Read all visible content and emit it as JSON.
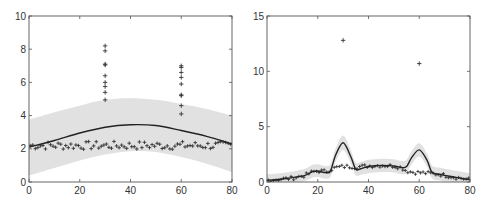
{
  "chart_data": [
    {
      "type": "scatter",
      "panel": "left",
      "title": "",
      "xlabel": "",
      "ylabel": "",
      "xlim": [
        0,
        80
      ],
      "ylim": [
        0,
        10
      ],
      "xticks": [
        0,
        20,
        40,
        60,
        80
      ],
      "yticks": [
        0,
        2,
        4,
        6,
        8,
        10
      ],
      "grid": false,
      "legend": null,
      "series": [
        {
          "name": "observations",
          "style": "plus-markers",
          "baseline_points": {
            "x_range": [
              0,
              80
            ],
            "y_approx": 2.2,
            "y_jitter": 0.25
          },
          "outliers": [
            {
              "x": 30,
              "y": [
                8.2,
                7.9,
                7.1,
                7.05,
                6.4,
                6.0,
                5.75,
                5.4,
                4.95
              ]
            },
            {
              "x": 60,
              "y": [
                7.0,
                6.9,
                6.6,
                6.3,
                5.9,
                5.25,
                5.2,
                4.6,
                4.1
              ]
            }
          ]
        },
        {
          "name": "fit",
          "style": "solid-line",
          "x": [
            0,
            10,
            20,
            30,
            40,
            50,
            60,
            70,
            80
          ],
          "y": [
            2.1,
            2.5,
            2.95,
            3.3,
            3.45,
            3.4,
            3.1,
            2.75,
            2.3
          ]
        },
        {
          "name": "confidence-band",
          "style": "shaded",
          "x": [
            0,
            10,
            20,
            30,
            40,
            50,
            60,
            70,
            80
          ],
          "upper": [
            3.75,
            4.2,
            4.6,
            4.95,
            5.05,
            4.95,
            4.7,
            4.4,
            4.0
          ],
          "lower": [
            0.4,
            0.85,
            1.3,
            1.65,
            1.85,
            1.8,
            1.5,
            1.1,
            0.6
          ]
        }
      ]
    },
    {
      "type": "scatter",
      "panel": "right",
      "title": "",
      "xlabel": "",
      "ylabel": "",
      "xlim": [
        0,
        80
      ],
      "ylim": [
        0,
        15
      ],
      "xticks": [
        0,
        20,
        40,
        60,
        80
      ],
      "yticks": [
        0,
        5,
        10,
        15
      ],
      "grid": false,
      "legend": null,
      "series": [
        {
          "name": "observations",
          "style": "plus-markers",
          "outliers": [
            {
              "x": 30,
              "y": 12.8
            },
            {
              "x": 60,
              "y": 10.7
            }
          ]
        },
        {
          "name": "fit",
          "style": "solid-line",
          "x": [
            0,
            5,
            10,
            15,
            18,
            20,
            23,
            25,
            27,
            30,
            33,
            35,
            37,
            40,
            45,
            50,
            53,
            55,
            57,
            60,
            63,
            65,
            68,
            70,
            75,
            80
          ],
          "y": [
            0.15,
            0.25,
            0.4,
            0.6,
            0.95,
            1.0,
            0.85,
            1.0,
            2.4,
            3.55,
            2.3,
            1.15,
            1.2,
            1.4,
            1.5,
            1.45,
            1.3,
            1.4,
            2.2,
            2.9,
            2.0,
            0.9,
            0.7,
            0.6,
            0.4,
            0.2
          ],
          "observations_trend_y": [
            0.15,
            0.25,
            0.35,
            0.6,
            0.9,
            1.0,
            0.95,
            1.1,
            1.3,
            1.4,
            1.4,
            1.35,
            1.4,
            1.45,
            1.5,
            1.45,
            1.3,
            1.0,
            0.9,
            0.85,
            0.8,
            0.75,
            0.7,
            0.6,
            0.4,
            0.2
          ]
        },
        {
          "name": "confidence-band",
          "style": "shaded",
          "x": [
            0,
            5,
            10,
            15,
            18,
            20,
            23,
            25,
            27,
            30,
            33,
            35,
            37,
            40,
            45,
            50,
            53,
            55,
            57,
            60,
            63,
            65,
            68,
            70,
            75,
            80
          ],
          "upper": [
            0.7,
            0.8,
            0.95,
            1.2,
            1.55,
            1.6,
            1.45,
            1.6,
            3.0,
            4.2,
            2.9,
            1.75,
            1.8,
            2.0,
            2.1,
            2.05,
            1.9,
            2.0,
            2.8,
            3.5,
            2.6,
            1.5,
            1.3,
            1.2,
            1.0,
            0.8
          ],
          "lower": [
            0.0,
            0.0,
            0.0,
            0.1,
            0.4,
            0.45,
            0.3,
            0.45,
            1.8,
            2.9,
            1.7,
            0.6,
            0.65,
            0.8,
            0.9,
            0.85,
            0.7,
            0.8,
            1.6,
            2.3,
            1.4,
            0.35,
            0.15,
            0.05,
            0.0,
            0.0
          ]
        }
      ]
    }
  ],
  "panels": [
    {
      "id": "left",
      "box": {
        "x0": 29,
        "y0": 16,
        "x1": 232,
        "y1": 182
      }
    },
    {
      "id": "right",
      "box": {
        "x0": 267,
        "y0": 16,
        "x1": 470,
        "y1": 182
      }
    }
  ]
}
